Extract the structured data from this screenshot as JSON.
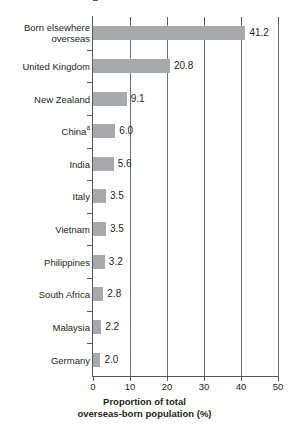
{
  "chart_data": {
    "type": "bar",
    "orientation": "horizontal",
    "title": "",
    "xlabel_line1": "Proportion of total",
    "xlabel_line2": "overseas-born population (%)",
    "ylabel": "",
    "xlim": [
      0,
      50
    ],
    "xticks": [
      "0",
      "10",
      "20",
      "30",
      "40",
      "50"
    ],
    "xtick_values": [
      0,
      10,
      20,
      30,
      40,
      50
    ],
    "grid": "vertical",
    "legend": "none",
    "bar_color": "#a7a9ac",
    "axis_color": "#58595b",
    "grid_color": "#6d6e71",
    "text_color": "#231f20",
    "categories": [
      "Born elsewhere overseas",
      "United Kingdom",
      "New Zealand",
      "China",
      "India",
      "Italy",
      "Vietnam",
      "Philippines",
      "South Africa",
      "Malaysia",
      "Germany"
    ],
    "values": [
      41.2,
      20.8,
      9.1,
      6.0,
      5.6,
      3.5,
      3.5,
      3.2,
      2.8,
      2.2,
      2.0
    ],
    "value_labels": [
      "41.2",
      "20.8",
      "9.1",
      "6.0",
      "5.6",
      "3.5",
      "3.5",
      "3.2",
      "2.8",
      "2.2",
      "2.0"
    ],
    "rows": [
      {
        "label_line1": "Born elsewhere",
        "label_line2": "overseas",
        "superscript": "",
        "value": 41.2,
        "value_label": "41.2"
      },
      {
        "label_line1": "United Kingdom",
        "label_line2": "",
        "superscript": "",
        "value": 20.8,
        "value_label": "20.8"
      },
      {
        "label_line1": "New Zealand",
        "label_line2": "",
        "superscript": "",
        "value": 9.1,
        "value_label": "9.1"
      },
      {
        "label_line1": "China",
        "label_line2": "",
        "superscript": "a",
        "value": 6.0,
        "value_label": "6.0"
      },
      {
        "label_line1": "India",
        "label_line2": "",
        "superscript": "",
        "value": 5.6,
        "value_label": "5.6"
      },
      {
        "label_line1": "Italy",
        "label_line2": "",
        "superscript": "",
        "value": 3.5,
        "value_label": "3.5"
      },
      {
        "label_line1": "Vietnam",
        "label_line2": "",
        "superscript": "",
        "value": 3.5,
        "value_label": "3.5"
      },
      {
        "label_line1": "Philippines",
        "label_line2": "",
        "superscript": "",
        "value": 3.2,
        "value_label": "3.2"
      },
      {
        "label_line1": "South Africa",
        "label_line2": "",
        "superscript": "",
        "value": 2.8,
        "value_label": "2.8"
      },
      {
        "label_line1": "Malaysia",
        "label_line2": "",
        "superscript": "",
        "value": 2.2,
        "value_label": "2.2"
      },
      {
        "label_line1": "Germany",
        "label_line2": "",
        "superscript": "",
        "value": 2.0,
        "value_label": "2.0"
      }
    ]
  }
}
